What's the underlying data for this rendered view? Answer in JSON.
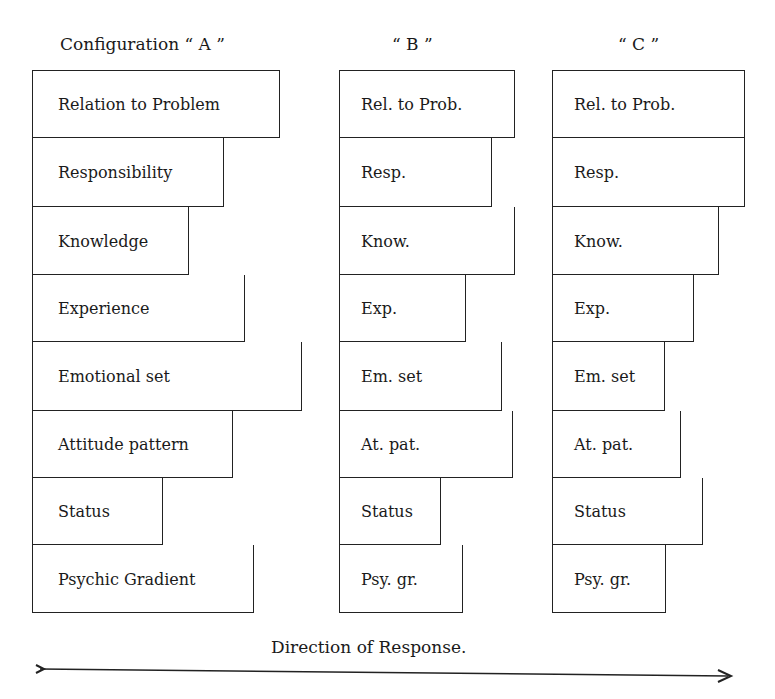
{
  "configurations": [
    {
      "title": "Configuration “ A ”",
      "left": 32,
      "title_x": 60,
      "items": [
        {
          "label": "Relation to Problem",
          "right": 280
        },
        {
          "label": "Responsibility",
          "right": 224
        },
        {
          "label": "Knowledge",
          "right": 189
        },
        {
          "label": "Experience",
          "right": 245
        },
        {
          "label": "Emotional set",
          "right": 302
        },
        {
          "label": "Attitude pattern",
          "right": 233
        },
        {
          "label": "Status",
          "right": 163
        },
        {
          "label": "Psychic Gradient",
          "right": 254
        }
      ]
    },
    {
      "title": "“ B ”",
      "left": 339,
      "title_x": 392,
      "items": [
        {
          "label": "Rel. to Prob.",
          "right": 515
        },
        {
          "label": "Resp.",
          "right": 492
        },
        {
          "label": "Know.",
          "right": 515
        },
        {
          "label": "Exp.",
          "right": 466
        },
        {
          "label": "Em. set",
          "right": 502
        },
        {
          "label": "At. pat.",
          "right": 513
        },
        {
          "label": "Status",
          "right": 441
        },
        {
          "label": "Psy. gr.",
          "right": 463
        }
      ]
    },
    {
      "title": "“ C ”",
      "left": 552,
      "title_x": 618,
      "items": [
        {
          "label": "Rel. to Prob.",
          "right": 745
        },
        {
          "label": "Resp.",
          "right": 745
        },
        {
          "label": "Know.",
          "right": 719
        },
        {
          "label": "Exp.",
          "right": 694
        },
        {
          "label": "Em. set",
          "right": 665
        },
        {
          "label": "At. pat.",
          "right": 681
        },
        {
          "label": "Status",
          "right": 703
        },
        {
          "label": "Psy. gr.",
          "right": 666
        }
      ]
    }
  ],
  "row_bounds": [
    70,
    138,
    207,
    275,
    342,
    411,
    478,
    545,
    613
  ],
  "axis": {
    "label": "Direction of Response.",
    "arrow": "right"
  }
}
